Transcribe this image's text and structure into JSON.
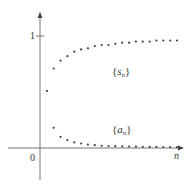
{
  "chart_data": {
    "type": "scatter",
    "title": "",
    "xlabel": "n",
    "ylabel": "",
    "origin_label": "0",
    "y_ticks": [
      {
        "value": 1,
        "label": "1"
      }
    ],
    "grid": false,
    "legend": "inline annotations",
    "series": [
      {
        "name": "{s_n}",
        "label_main": "s",
        "label_sub": "n",
        "description": "increasing sequence converging to 1",
        "x": [
          1,
          2,
          3,
          4,
          5,
          6,
          7,
          8,
          9,
          10,
          11,
          12,
          13,
          14,
          15,
          16,
          17,
          18,
          19,
          20
        ],
        "values": [
          0.51,
          0.71,
          0.78,
          0.82,
          0.86,
          0.88,
          0.89,
          0.91,
          0.92,
          0.92,
          0.93,
          0.94,
          0.94,
          0.95,
          0.95,
          0.95,
          0.96,
          0.96,
          0.96,
          0.96
        ]
      },
      {
        "name": "{a_n}",
        "label_main": "a",
        "label_sub": "n",
        "description": "decreasing sequence converging to 0",
        "x": [
          2,
          3,
          4,
          5,
          6,
          7,
          8,
          9,
          10,
          11,
          12,
          13,
          14,
          15,
          16,
          17,
          18,
          19,
          20
        ],
        "values": [
          0.18,
          0.1,
          0.07,
          0.05,
          0.04,
          0.03,
          0.025,
          0.02,
          0.018,
          0.016,
          0.014,
          0.013,
          0.012,
          0.011,
          0.01,
          0.01,
          0.009,
          0.009,
          0.008
        ]
      }
    ],
    "annotations": [
      {
        "text": "{s_n}",
        "near_series": "s_n"
      },
      {
        "text": "{a_n}",
        "near_series": "a_n"
      }
    ],
    "colors": {
      "axis": "#555555",
      "points": "#444444",
      "text": "#333333"
    }
  }
}
